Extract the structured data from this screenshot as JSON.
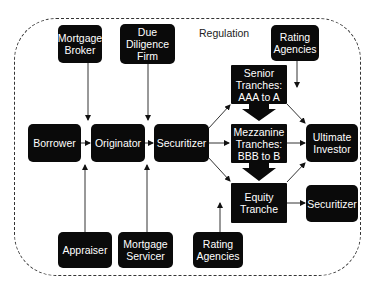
{
  "diagram": {
    "boundary_label": "Regulation",
    "nodes": {
      "mortgage_broker": "Mortgage\nBroker",
      "due_diligence_firm": "Due\nDiligence\nFirm",
      "rating_agencies_top": "Rating\nAgencies",
      "senior_tranches": "Senior\nTranches:\nAAA to A",
      "borrower": "Borrower",
      "originator": "Originator",
      "securitizer": "Securitizer",
      "mezzanine_tranches": "Mezzanine\nTranches:\nBBB to B",
      "ultimate_investor": "Ultimate\nInvestor",
      "equity_tranche": "Equity\nTranche",
      "securitizer_right": "Securitizer",
      "appraiser": "Appraiser",
      "mortgage_servicer": "Mortgage\nServicer",
      "rating_agencies_bottom": "Rating\nAgencies"
    },
    "edges": [
      {
        "from": "Mortgage Broker",
        "to": "Originator"
      },
      {
        "from": "Due Diligence Firm",
        "to": "Securitizer"
      },
      {
        "from": "Borrower",
        "to": "Originator"
      },
      {
        "from": "Originator",
        "to": "Securitizer"
      },
      {
        "from": "Securitizer",
        "to": "Senior Tranches: AAA to A"
      },
      {
        "from": "Securitizer",
        "to": "Mezzanine Tranches: BBB to B"
      },
      {
        "from": "Securitizer",
        "to": "Equity Tranche"
      },
      {
        "from": "Senior Tranches: AAA to A",
        "to": "Mezzanine Tranches: BBB to B",
        "style": "thick"
      },
      {
        "from": "Mezzanine Tranches: BBB to B",
        "to": "Equity Tranche",
        "style": "thick"
      },
      {
        "from": "Senior Tranches: AAA to A",
        "to": "Ultimate Investor"
      },
      {
        "from": "Mezzanine Tranches: BBB to B",
        "to": "Ultimate Investor"
      },
      {
        "from": "Equity Tranche",
        "to": "Ultimate Investor"
      },
      {
        "from": "Equity Tranche",
        "to": "Securitizer"
      },
      {
        "from": "Rating Agencies",
        "to": "Ultimate Investor"
      },
      {
        "from": "Rating Agencies",
        "to": "Equity Tranche"
      },
      {
        "from": "Appraiser",
        "to": "Originator"
      },
      {
        "from": "Mortgage Servicer",
        "to": "Securitizer"
      }
    ]
  }
}
